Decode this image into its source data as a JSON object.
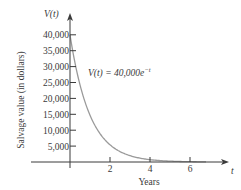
{
  "chart_data": {
    "type": "line",
    "title": "",
    "xlabel": "Years",
    "ylabel": "Salvage value (in dollars)",
    "x_axis_var": "t",
    "y_axis_var": "V(t)",
    "annotation": {
      "lhs": "V(t) = 40,000",
      "base": "e",
      "exponent": "−t"
    },
    "x_ticks": [
      2,
      4,
      6
    ],
    "x_tick_labels": [
      "2",
      "4",
      "6"
    ],
    "y_ticks": [
      5000,
      10000,
      15000,
      20000,
      25000,
      30000,
      35000,
      40000
    ],
    "y_tick_labels": [
      "5,000",
      "10,000",
      "15,000",
      "20,000",
      "25,000",
      "30,000",
      "35,000",
      "40,000"
    ],
    "xlim": [
      -1.4,
      7.6
    ],
    "ylim": [
      0,
      43000
    ],
    "grid": false,
    "legend": "none",
    "series": [
      {
        "name": "V(t) = 40,000e^(-t)",
        "x": [
          0,
          0.25,
          0.5,
          0.75,
          1,
          1.5,
          2,
          2.5,
          3,
          3.5,
          4,
          5,
          6,
          7
        ],
        "values": [
          40000,
          31152,
          24261,
          18895,
          14715,
          8925,
          5413,
          3283,
          1991,
          1208,
          733,
          270,
          99,
          36
        ]
      }
    ],
    "colors": {
      "axis": "#3a3a3a",
      "curve": "#9a9a9a",
      "text": "#3a3a3a"
    }
  }
}
